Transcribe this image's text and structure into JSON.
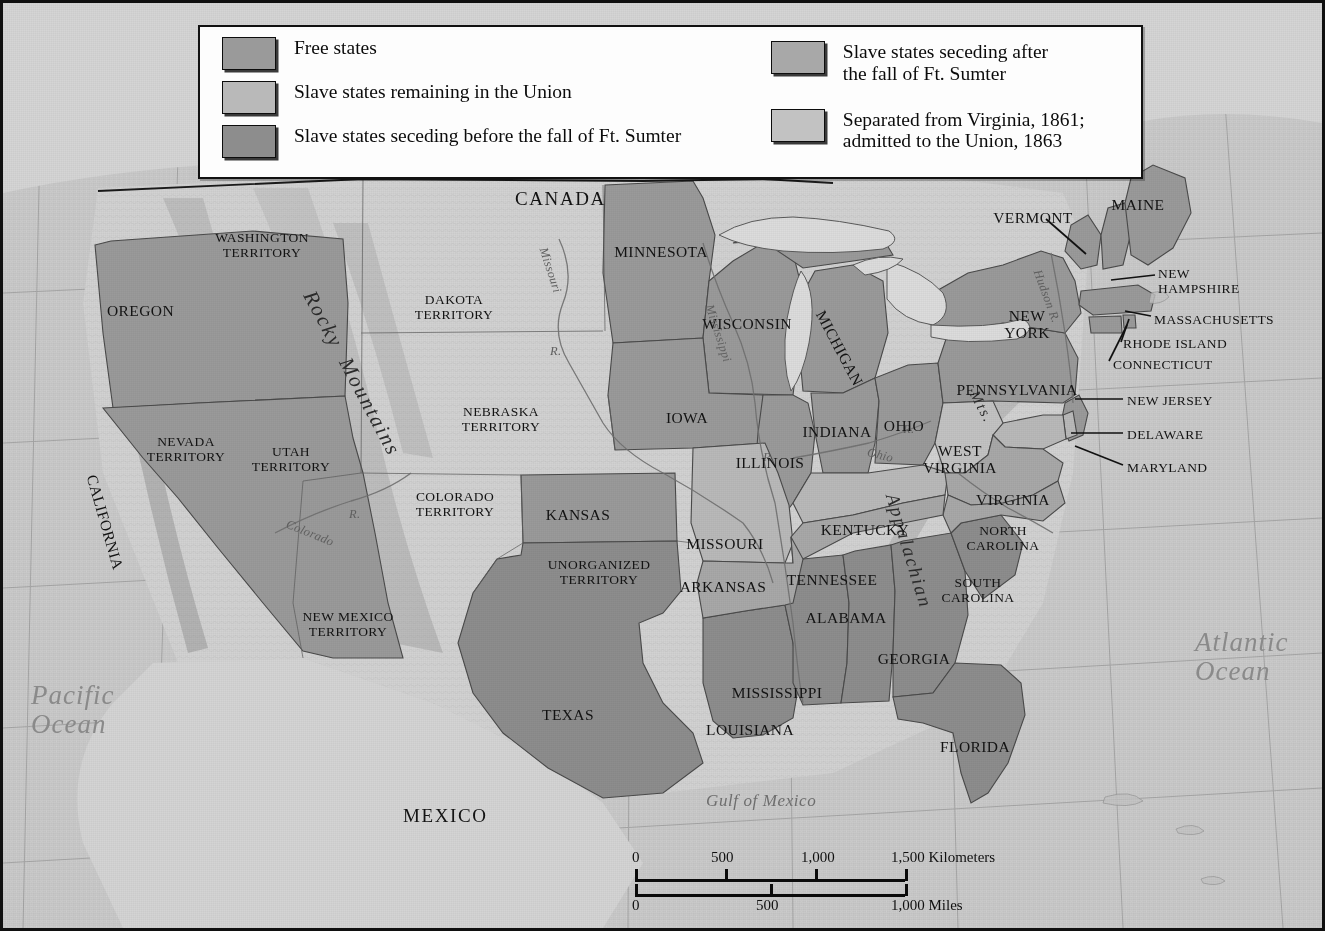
{
  "map": {
    "title": "The United States on the Eve of the Civil War, 1861",
    "frame_color": "#101010",
    "background_color": "#c9c9c9"
  },
  "legend": {
    "background": "#fdfdfd",
    "border_color": "#121212",
    "left_items": [
      {
        "label": "Free states",
        "color": "#9a9a9a",
        "icon": "legend-swatch"
      },
      {
        "label": "Slave states remaining in the Union",
        "color": "#b9b9b9",
        "icon": "legend-swatch"
      },
      {
        "label": "Slave states seceding before the fall of Ft. Sumter",
        "color": "#8d8d8d",
        "icon": "legend-swatch"
      }
    ],
    "right_items": [
      {
        "label": "Slave states seceding after\nthe fall of Ft. Sumter",
        "color": "#a8a8a8",
        "icon": "legend-swatch"
      },
      {
        "label": "Separated from Virginia, 1861;\nadmitted to the Union, 1863",
        "color": "#c2c2c2",
        "icon": "legend-swatch"
      }
    ]
  },
  "scalebar": {
    "kilometers": {
      "ticks": [
        "0",
        "500",
        "1,000",
        "1,500"
      ],
      "unit_label": "Kilometers",
      "max": 1500
    },
    "miles": {
      "ticks": [
        "0",
        "500",
        "1,000"
      ],
      "unit_label": "Miles",
      "max": 1000
    }
  },
  "labels": {
    "countries": [
      {
        "name": "CANADA",
        "x": 512,
        "y": 186
      },
      {
        "name": "MEXICO",
        "x": 400,
        "y": 803
      }
    ],
    "oceans": [
      {
        "name": "Pacific\nOcean",
        "x": 28,
        "y": 678,
        "size": "big"
      },
      {
        "name": "Atlantic\nOcean",
        "x": 1192,
        "y": 625,
        "size": "big"
      },
      {
        "name": "Gulf of Mexico",
        "x": 703,
        "y": 789,
        "size": "normal"
      }
    ],
    "rivers": [
      {
        "name": "Missouri",
        "x": 546,
        "y": 243,
        "rotate": 72
      },
      {
        "name": "R.",
        "x": 547,
        "y": 342,
        "rotate": 0
      },
      {
        "name": "Mississippi",
        "x": 712,
        "y": 300,
        "rotate": 72
      },
      {
        "name": "Ohio",
        "x": 866,
        "y": 443,
        "rotate": 14
      },
      {
        "name": "R.",
        "x": 900,
        "y": 420,
        "rotate": 0
      },
      {
        "name": "R.",
        "x": 760,
        "y": 448,
        "rotate": 0
      },
      {
        "name": "Colorado",
        "x": 286,
        "y": 515,
        "rotate": 22
      },
      {
        "name": "R.",
        "x": 346,
        "y": 505,
        "rotate": 0
      },
      {
        "name": "Hudson R.",
        "x": 1040,
        "y": 265,
        "rotate": 70
      }
    ],
    "mountains": [
      {
        "name": "Rocky  Mountains",
        "x": 316,
        "y": 284,
        "rotate": 62,
        "size": 21
      },
      {
        "name": "Appalachian",
        "x": 898,
        "y": 488,
        "rotate": 73,
        "size": 19
      },
      {
        "name": "Mts.",
        "x": 978,
        "y": 385,
        "rotate": 62,
        "size": 15
      }
    ],
    "states": [
      {
        "name": "WASHINGTON\nTERRITORY",
        "x": 259,
        "y": 228,
        "anchor": "center"
      },
      {
        "name": "OREGON",
        "x": 104,
        "y": 300,
        "anchor": "left"
      },
      {
        "name": "NEVADA\nTERRITORY",
        "x": 183,
        "y": 432,
        "anchor": "center"
      },
      {
        "name": "UTAH\nTERRITORY",
        "x": 288,
        "y": 442,
        "anchor": "center"
      },
      {
        "name": "CALIFORNIA",
        "x": 96,
        "y": 470,
        "anchor": "left",
        "rotate": 74
      },
      {
        "name": "DAKOTA\nTERRITORY",
        "x": 451,
        "y": 290,
        "anchor": "center"
      },
      {
        "name": "NEBRASKA\nTERRITORY",
        "x": 498,
        "y": 402,
        "anchor": "center"
      },
      {
        "name": "COLORADO\nTERRITORY",
        "x": 452,
        "y": 487,
        "anchor": "center"
      },
      {
        "name": "NEW MEXICO\nTERRITORY",
        "x": 345,
        "y": 607,
        "anchor": "center"
      },
      {
        "name": "KANSAS",
        "x": 575,
        "y": 504,
        "anchor": "center"
      },
      {
        "name": "UNORGANIZED\nTERRITORY",
        "x": 596,
        "y": 555,
        "anchor": "center"
      },
      {
        "name": "TEXAS",
        "x": 565,
        "y": 704,
        "anchor": "center"
      },
      {
        "name": "MINNESOTA",
        "x": 658,
        "y": 241,
        "anchor": "center"
      },
      {
        "name": "WISCONSIN",
        "x": 744,
        "y": 313,
        "anchor": "center"
      },
      {
        "name": "MICHIGAN",
        "x": 824,
        "y": 305,
        "anchor": "center",
        "rotate": 62
      },
      {
        "name": "IOWA",
        "x": 684,
        "y": 407,
        "anchor": "center"
      },
      {
        "name": "ILLINOIS",
        "x": 767,
        "y": 452,
        "anchor": "center"
      },
      {
        "name": "INDIANA",
        "x": 834,
        "y": 421,
        "anchor": "center"
      },
      {
        "name": "OHIO",
        "x": 901,
        "y": 415,
        "anchor": "center"
      },
      {
        "name": "MISSOURI",
        "x": 722,
        "y": 533,
        "anchor": "center"
      },
      {
        "name": "ARKANSAS",
        "x": 720,
        "y": 576,
        "anchor": "center"
      },
      {
        "name": "KENTUCKY",
        "x": 862,
        "y": 519,
        "anchor": "center"
      },
      {
        "name": "TENNESSEE",
        "x": 829,
        "y": 569,
        "anchor": "center"
      },
      {
        "name": "MISSISSIPPI",
        "x": 774,
        "y": 682,
        "anchor": "center"
      },
      {
        "name": "LOUISIANA",
        "x": 747,
        "y": 719,
        "anchor": "center"
      },
      {
        "name": "ALABAMA",
        "x": 843,
        "y": 607,
        "anchor": "center"
      },
      {
        "name": "GEORGIA",
        "x": 911,
        "y": 648,
        "anchor": "center"
      },
      {
        "name": "FLORIDA",
        "x": 972,
        "y": 736,
        "anchor": "center"
      },
      {
        "name": "SOUTH\nCAROLINA",
        "x": 975,
        "y": 573,
        "anchor": "center"
      },
      {
        "name": "NORTH\nCAROLINA",
        "x": 1000,
        "y": 521,
        "anchor": "center"
      },
      {
        "name": "VIRGINIA",
        "x": 1010,
        "y": 489,
        "anchor": "center"
      },
      {
        "name": "WEST\nVIRGINIA",
        "x": 957,
        "y": 440,
        "anchor": "center"
      },
      {
        "name": "PENNSYLVANIA",
        "x": 1014,
        "y": 379,
        "anchor": "center"
      },
      {
        "name": "NEW\nYORK",
        "x": 1024,
        "y": 305,
        "anchor": "center"
      },
      {
        "name": "VERMONT",
        "x": 1030,
        "y": 207,
        "anchor": "center"
      },
      {
        "name": "MAINE",
        "x": 1135,
        "y": 194,
        "anchor": "center"
      }
    ],
    "callout_states": [
      {
        "name": "NEW\nHAMPSHIRE",
        "x": 1155,
        "y": 264,
        "line": [
          1152,
          272,
          1108,
          277
        ]
      },
      {
        "name": "MASSACHUSETTS",
        "x": 1151,
        "y": 310,
        "line": [
          1148,
          313,
          1122,
          308
        ]
      },
      {
        "name": "RHODE ISLAND",
        "x": 1120,
        "y": 334,
        "line": [
          1118,
          339,
          1126,
          316
        ]
      },
      {
        "name": "CONNECTICUT",
        "x": 1110,
        "y": 355,
        "line": [
          1106,
          358,
          1124,
          322
        ]
      },
      {
        "name": "NEW JERSEY",
        "x": 1124,
        "y": 391,
        "line": [
          1120,
          396,
          1072,
          396
        ]
      },
      {
        "name": "DELAWARE",
        "x": 1124,
        "y": 425,
        "line": [
          1120,
          430,
          1068,
          430
        ]
      },
      {
        "name": "MARYLAND",
        "x": 1124,
        "y": 458,
        "line": [
          1120,
          462,
          1072,
          443
        ]
      },
      {
        "name": "VERMONT-LEADER",
        "x": -999,
        "y": -999,
        "line": [
          1043,
          216,
          1083,
          251
        ]
      }
    ]
  },
  "colors": {
    "free_state": "#9a9a9a",
    "slave_union": "#b9b9b9",
    "seceded_before": "#8d8d8d",
    "seceded_after": "#a8a8a8",
    "west_virginia": "#c2c2c2",
    "territory": "#d2d2d2",
    "ocean": "#c9c9c9",
    "border": "#4a4a4a"
  }
}
